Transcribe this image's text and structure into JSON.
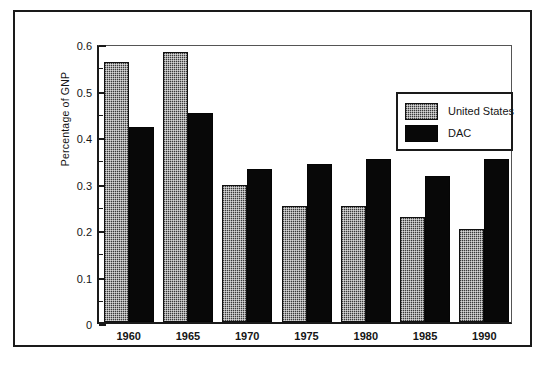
{
  "chart_data": {
    "type": "bar",
    "title": "",
    "xlabel": "",
    "ylabel": "Percentage of GNP",
    "categories": [
      "1960",
      "1965",
      "1970",
      "1975",
      "1980",
      "1985",
      "1990"
    ],
    "series": [
      {
        "name": "United States",
        "color": "#3a3a3a",
        "pattern": "checkerboard-dither",
        "values": [
          0.56,
          0.58,
          0.295,
          0.25,
          0.25,
          0.225,
          0.2
        ]
      },
      {
        "name": "DAC",
        "color": "#080808",
        "pattern": "solid",
        "values": [
          0.42,
          0.45,
          0.33,
          0.34,
          0.35,
          0.315,
          0.35
        ]
      }
    ],
    "ylim": [
      0,
      0.6
    ],
    "ytick_labels": [
      "0",
      "0.1",
      "0.2",
      "0.3",
      "0.4",
      "0.5",
      "0.6"
    ],
    "ytick_values": [
      0,
      0.1,
      0.2,
      0.3,
      0.4,
      0.5,
      0.6
    ],
    "yminor_tick_values": [
      0.05,
      0.15,
      0.25,
      0.35,
      0.45,
      0.55
    ],
    "grid": false,
    "legend_position": "top-right-inside"
  },
  "legend": {
    "entries": [
      {
        "label": "United States",
        "swatch": "us-hatched-swatch"
      },
      {
        "label": "DAC",
        "swatch": "dac-solid-swatch"
      }
    ]
  },
  "axes": {
    "y_title": "Percentage of GNP"
  }
}
